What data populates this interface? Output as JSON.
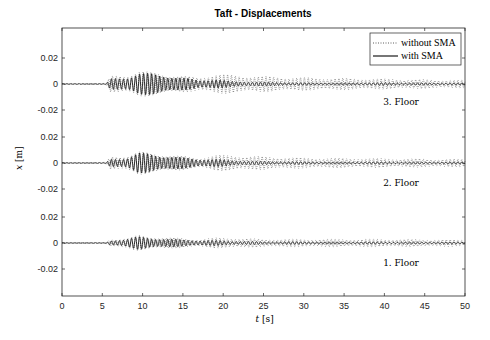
{
  "chart_data": {
    "type": "line",
    "title": "Taft - Displacements",
    "xlabel": "t [s]",
    "xlabel_var": "t",
    "xlabel_unit": "[s]",
    "ylabel": "x [m]",
    "ylabel_var": "x",
    "ylabel_unit": "[m]",
    "xlim": [
      0,
      50
    ],
    "x_ticks": [
      0,
      5,
      10,
      15,
      20,
      25,
      30,
      35,
      40,
      45,
      50
    ],
    "y_tick_labels": [
      "0.02",
      "0",
      "-0.02",
      "0.02",
      "0",
      "-0.02",
      "0.02",
      "0",
      "-0.02"
    ],
    "grid": false,
    "legend_position": "upper right",
    "legend": [
      {
        "label": "without SMA",
        "style": "dotted"
      },
      {
        "label": "with SMA",
        "style": "solid"
      }
    ],
    "panels": [
      {
        "label": "3. Floor",
        "ylim": [
          -0.035,
          0.035
        ],
        "offset_tick": 0,
        "series": [
          {
            "name": "without SMA",
            "envelope": [
              [
                0,
                0.0003
              ],
              [
                5.5,
                0.0005
              ],
              [
                6,
                0.006
              ],
              [
                8,
                0.007
              ],
              [
                9.5,
                0.011
              ],
              [
                11,
                0.009
              ],
              [
                14,
                0.007
              ],
              [
                17,
                0.005
              ],
              [
                19,
                0.008
              ],
              [
                21,
                0.007
              ],
              [
                25,
                0.006
              ],
              [
                30,
                0.005
              ],
              [
                40,
                0.004
              ],
              [
                50,
                0.003
              ]
            ]
          },
          {
            "name": "with SMA",
            "envelope": [
              [
                0,
                0.0002
              ],
              [
                5.5,
                0.0004
              ],
              [
                6,
                0.004
              ],
              [
                8,
                0.005
              ],
              [
                9.5,
                0.009
              ],
              [
                11,
                0.008
              ],
              [
                14,
                0.006
              ],
              [
                17,
                0.003
              ],
              [
                19,
                0.004
              ],
              [
                21,
                0.002
              ],
              [
                25,
                0.0015
              ],
              [
                30,
                0.001
              ],
              [
                40,
                0.001
              ],
              [
                50,
                0.0008
              ]
            ]
          }
        ]
      },
      {
        "label": "2. Floor",
        "ylim": [
          -0.035,
          0.035
        ],
        "offset_tick": 0,
        "series": [
          {
            "name": "without SMA",
            "envelope": [
              [
                0,
                0.0003
              ],
              [
                5.5,
                0.0005
              ],
              [
                6,
                0.005
              ],
              [
                8,
                0.006
              ],
              [
                9.5,
                0.009
              ],
              [
                11,
                0.008
              ],
              [
                14,
                0.006
              ],
              [
                17,
                0.004
              ],
              [
                19,
                0.006
              ],
              [
                21,
                0.006
              ],
              [
                25,
                0.005
              ],
              [
                30,
                0.004
              ],
              [
                40,
                0.0035
              ],
              [
                50,
                0.003
              ]
            ]
          },
          {
            "name": "with SMA",
            "envelope": [
              [
                0,
                0.0002
              ],
              [
                5.5,
                0.0004
              ],
              [
                6,
                0.003
              ],
              [
                8,
                0.004
              ],
              [
                9.5,
                0.008
              ],
              [
                11,
                0.007
              ],
              [
                14,
                0.005
              ],
              [
                17,
                0.003
              ],
              [
                19,
                0.003
              ],
              [
                21,
                0.002
              ],
              [
                25,
                0.0012
              ],
              [
                30,
                0.001
              ],
              [
                40,
                0.0008
              ],
              [
                50,
                0.0008
              ]
            ]
          }
        ]
      },
      {
        "label": "1. Floor",
        "ylim": [
          -0.035,
          0.035
        ],
        "offset_tick": 0,
        "series": [
          {
            "name": "without SMA",
            "envelope": [
              [
                0,
                0.0002
              ],
              [
                5.5,
                0.0004
              ],
              [
                6,
                0.003
              ],
              [
                8,
                0.004
              ],
              [
                9.5,
                0.006
              ],
              [
                11,
                0.005
              ],
              [
                14,
                0.004
              ],
              [
                17,
                0.003
              ],
              [
                19,
                0.004
              ],
              [
                21,
                0.004
              ],
              [
                25,
                0.003
              ],
              [
                30,
                0.003
              ],
              [
                40,
                0.003
              ],
              [
                50,
                0.0025
              ]
            ]
          },
          {
            "name": "with SMA",
            "envelope": [
              [
                0,
                0.0002
              ],
              [
                5.5,
                0.0003
              ],
              [
                6,
                0.002
              ],
              [
                8,
                0.003
              ],
              [
                9.5,
                0.005
              ],
              [
                11,
                0.004
              ],
              [
                14,
                0.003
              ],
              [
                17,
                0.002
              ],
              [
                19,
                0.002
              ],
              [
                21,
                0.0015
              ],
              [
                25,
                0.001
              ],
              [
                30,
                0.001
              ],
              [
                40,
                0.0008
              ],
              [
                50,
                0.0008
              ]
            ]
          }
        ]
      }
    ]
  },
  "colors": {
    "axis": "#262626",
    "with_sma": "#1a1a1a",
    "without_sma": "#333333",
    "background": "#ffffff"
  }
}
